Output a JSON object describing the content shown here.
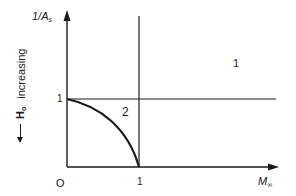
{
  "diagram": {
    "y_axis_label": "1/A",
    "y_axis_label_sub": "s",
    "x_axis_label": "M",
    "x_axis_label_sub": "∞",
    "origin_label": "O",
    "x_tick_1": "1",
    "y_tick_1": "1",
    "region_1_label": "1",
    "region_2_label": "2",
    "side_annotation": {
      "symbol": "H",
      "symbol_sub": "o",
      "text": "increasing",
      "direction": "down-arrow"
    },
    "elements": {
      "horizontal_line": "1/A = 1",
      "vertical_line": "M = 1",
      "curve": "from (0,1) to (1,0), concave"
    },
    "colors": {
      "ink": "#1a1a1a",
      "background": "#ffffff"
    }
  }
}
